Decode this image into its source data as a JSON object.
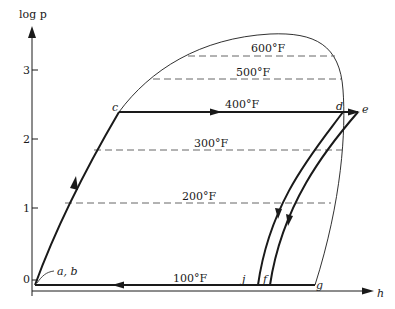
{
  "diagram": {
    "y_axis": {
      "label": "log p",
      "ticks": [
        "0",
        "1",
        "2",
        "3"
      ]
    },
    "x_axis": {
      "label": "h"
    },
    "isotherms": [
      {
        "label": "600°F"
      },
      {
        "label": "500°F"
      },
      {
        "label": "400°F"
      },
      {
        "label": "300°F"
      },
      {
        "label": "200°F"
      },
      {
        "label": "100°F"
      }
    ],
    "points": {
      "ab": "a, b",
      "c": "c",
      "d": "d",
      "e": "e",
      "f": "f",
      "g": "g",
      "j": "j"
    },
    "colors": {
      "ink": "#1a1a1a",
      "dashed": "#555555",
      "background": "#ffffff"
    }
  }
}
